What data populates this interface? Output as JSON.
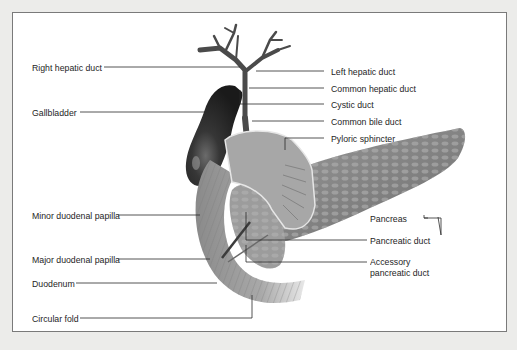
{
  "figure": {
    "labels_left": [
      {
        "id": "right-hepatic-duct",
        "text": "Right hepatic duct"
      },
      {
        "id": "gallbladder",
        "text": "Gallbladder"
      },
      {
        "id": "minor-duodenal-papilla",
        "text": "Minor duodenal papilla"
      },
      {
        "id": "major-duodenal-papilla",
        "text": "Major duodenal papilla"
      },
      {
        "id": "duodenum",
        "text": "Duodenum"
      },
      {
        "id": "circular-fold",
        "text": "Circular fold"
      }
    ],
    "labels_right": [
      {
        "id": "left-hepatic-duct",
        "text": "Left hepatic duct"
      },
      {
        "id": "common-hepatic-duct",
        "text": "Common hepatic duct"
      },
      {
        "id": "cystic-duct",
        "text": "Cystic duct"
      },
      {
        "id": "common-bile-duct",
        "text": "Common bile duct"
      },
      {
        "id": "pyloric-sphincter",
        "text": "Pyloric sphincter"
      },
      {
        "id": "pancreas",
        "text": "Pancreas"
      },
      {
        "id": "pancreatic-duct",
        "text": "Pancreatic duct"
      },
      {
        "id": "accessory-pancreatic-duct-1",
        "text": "Accessory"
      },
      {
        "id": "accessory-pancreatic-duct-2",
        "text": "pancreatic duct"
      }
    ]
  },
  "colors": {
    "background": "#ececea",
    "frame_fill": "#ffffff",
    "frame_border": "#7a7a7a",
    "leader_line": "#2a2a2a",
    "gallbladder": "#2b2b2b",
    "tissue": "#8e8e8e",
    "tissue_light": "#b5b5b5"
  }
}
